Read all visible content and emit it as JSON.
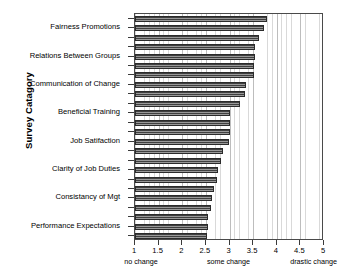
{
  "chart_data": {
    "type": "bar",
    "orientation": "horizontal",
    "title": "",
    "xlabel": "",
    "ylabel": "Survey Catagory",
    "xlim": [
      1,
      5
    ],
    "ylim": [
      0,
      24
    ],
    "grid": true,
    "legend": null,
    "xticks": [
      "1",
      "1.5",
      "2",
      "2.5",
      "3",
      "3.5",
      "4",
      "4.5",
      "5"
    ],
    "xtick_values": [
      1,
      1.5,
      2,
      2.5,
      3,
      3.5,
      4,
      4.5,
      5
    ],
    "annotations": [
      {
        "text": "no change",
        "value": 1.15
      },
      {
        "text": "some change",
        "value": 3.0
      },
      {
        "text": "drastic change",
        "value": 4.8
      }
    ],
    "category_labels": [
      "Fairness Promotions",
      "Relations Between Groups",
      "Communication of Change",
      "Beneficial Training",
      "Job Satifaction",
      "Clarity of Job Duties",
      "Consistancy of Mgt",
      "Performance Expectations"
    ],
    "categories": [
      "bar-01",
      "bar-02",
      "bar-03",
      "bar-04",
      "bar-05",
      "bar-06",
      "bar-07",
      "bar-08",
      "bar-09",
      "bar-10",
      "bar-11",
      "bar-12",
      "bar-13",
      "bar-14",
      "bar-15",
      "bar-16",
      "bar-17",
      "bar-18",
      "bar-19",
      "bar-20",
      "bar-21",
      "bar-22",
      "bar-23",
      "bar-24"
    ],
    "values": [
      3.8,
      3.72,
      3.62,
      3.55,
      3.53,
      3.52,
      3.51,
      3.35,
      3.33,
      3.22,
      3.02,
      3.02,
      3.0,
      2.99,
      2.86,
      2.82,
      2.76,
      2.73,
      2.67,
      2.63,
      2.6,
      2.55,
      2.54,
      2.52
    ],
    "bar_color": "#6d6d6d",
    "bar_edge_color": "#2b2b2b",
    "grid_color": "#d9d9d9",
    "frame_color": "#4a4a4a"
  }
}
